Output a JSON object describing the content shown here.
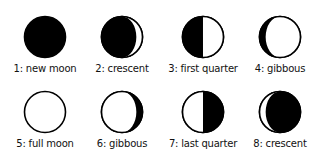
{
  "colors": {
    "dark": "#000000",
    "light": "#ffffff",
    "outline": "#000000"
  },
  "phases": [
    {
      "number": "1",
      "label": "1: new moon",
      "name": "new moon",
      "illumination": 0.0,
      "lit_side": "none"
    },
    {
      "number": "2",
      "label": "2: crescent",
      "name": "crescent",
      "illumination": 0.15,
      "lit_side": "right"
    },
    {
      "number": "3",
      "label": "3: first quarter",
      "name": "first quarter",
      "illumination": 0.5,
      "lit_side": "right"
    },
    {
      "number": "4",
      "label": "4: gibbous",
      "name": "gibbous",
      "illumination": 0.85,
      "lit_side": "right"
    },
    {
      "number": "5",
      "label": "5: full moon",
      "name": "full moon",
      "illumination": 1.0,
      "lit_side": "all"
    },
    {
      "number": "6",
      "label": "6: gibbous",
      "name": "gibbous",
      "illumination": 0.85,
      "lit_side": "left"
    },
    {
      "number": "7",
      "label": "7: last quarter",
      "name": "last quarter",
      "illumination": 0.5,
      "lit_side": "left"
    },
    {
      "number": "8",
      "label": "8: crescent",
      "name": "crescent",
      "illumination": 0.15,
      "lit_side": "left"
    }
  ]
}
